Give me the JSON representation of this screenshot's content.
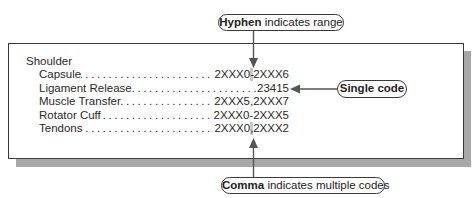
{
  "figure": {
    "heading": "Shoulder",
    "entries": [
      {
        "label": "Capsule",
        "code_pre": "2XXX0",
        "code_sep": "-",
        "code_post": "2XXX6",
        "highlight": "separator"
      },
      {
        "label": "Ligament Release",
        "code": "23415",
        "highlight": "code"
      },
      {
        "label": "Muscle Transfer",
        "code": "2XXX5,2XXX7",
        "highlight": "none"
      },
      {
        "label": "Rotator Cuff",
        "code": "2XXX0-2XXX5",
        "highlight": "none"
      },
      {
        "label": "Tendons",
        "code_pre": "2XXX0",
        "code_sep": ",",
        "code_post": "2XXX2",
        "highlight": "separator"
      }
    ],
    "dot_leader": "................................................................"
  },
  "callouts": {
    "hyphen": {
      "bold": "Hyphen",
      "rest": " indicates range"
    },
    "single": {
      "text": "Single code"
    },
    "comma": {
      "bold": "Comma",
      "rest": " indicates multiple codes"
    }
  },
  "colors": {
    "border": "#3a3a3a",
    "shadow": "#a8a8a8",
    "highlight": "#bdbdbd",
    "arrow": "#555555"
  }
}
